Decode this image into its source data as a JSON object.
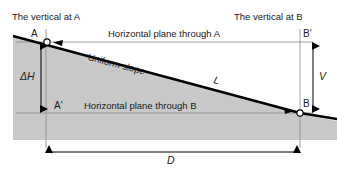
{
  "figure": {
    "colors": {
      "ground_fill": "#c9c9c9",
      "slope_line": "#000000",
      "thin_line": "#8a8a8a",
      "text": "#1a1a1a"
    },
    "labels": {
      "vertical_at_a": "The vertical at A",
      "vertical_at_b": "The vertical at B",
      "horizontal_plane_a": "Horizontal plane through A",
      "horizontal_plane_b": "Horizontal plane through B",
      "uniform_slope": "Uniform slope",
      "point_a": "A",
      "point_a_prime": "A'",
      "point_b": "B",
      "point_b_prime": "B'",
      "slope_length": "L",
      "delta_h": "ΔH",
      "vertical_v": "V",
      "horizontal_d": "D"
    },
    "geometry": {
      "point_a": [
        47,
        42
      ],
      "point_b": [
        300,
        113
      ],
      "a_prime": [
        47,
        113
      ],
      "b_prime": [
        300,
        42
      ],
      "ground_left": 13,
      "ground_bottom": 140,
      "slope_start": [
        13,
        36
      ],
      "slope_end": [
        337,
        120
      ],
      "dim_d_y": 152,
      "dim_dh_x": 41,
      "dim_v_x": 313
    }
  }
}
